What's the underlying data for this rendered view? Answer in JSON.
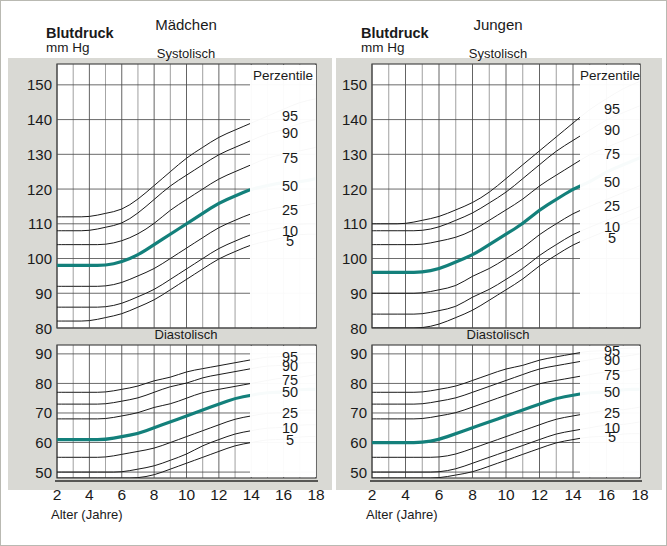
{
  "figure": {
    "background": "#ffffff",
    "plot_background": "#ffffff",
    "border_color": "#c9c9c2",
    "grid_color": "#4a4a4a",
    "curve_color": "#1a1a1a",
    "median_color": "#13807b",
    "text_color": "#1a1a1a",
    "axis_label_x": "Alter (Jahre)"
  },
  "panels": [
    {
      "id": "maedchen",
      "group_title": "Mädchen",
      "axis_title_line1": "Blutdruck",
      "axis_title_line2": "mm Hg",
      "legend_title": "Perzentile",
      "charts": [
        {
          "id": "maedchen-systolisch",
          "subtitle": "Systolisch",
          "yticks": [
            150,
            140,
            130,
            120,
            110,
            100,
            90,
            80
          ],
          "ylim": [
            80,
            156
          ],
          "percentile_labels": [
            "95",
            "90",
            "75",
            "50",
            "25",
            "10",
            "5"
          ]
        },
        {
          "id": "maedchen-diastolisch",
          "subtitle": "Diastolisch",
          "yticks": [
            90,
            80,
            70,
            60,
            50
          ],
          "ylim": [
            48,
            93
          ],
          "percentile_labels": [
            "95",
            "90",
            "75",
            "50",
            "25",
            "10",
            "5"
          ]
        }
      ]
    },
    {
      "id": "jungen",
      "group_title": "Jungen",
      "axis_title_line1": "Blutdruck",
      "axis_title_line2": "mm Hg",
      "legend_title": "Perzentile",
      "charts": [
        {
          "id": "jungen-systolisch",
          "subtitle": "Systolisch",
          "yticks": [
            150,
            140,
            130,
            120,
            110,
            100,
            90,
            80
          ],
          "ylim": [
            80,
            156
          ],
          "percentile_labels": [
            "95",
            "90",
            "75",
            "50",
            "25",
            "10",
            "5"
          ]
        },
        {
          "id": "jungen-diastolisch",
          "subtitle": "Diastolisch",
          "yticks": [
            90,
            80,
            70,
            60,
            50
          ],
          "ylim": [
            48,
            93
          ],
          "percentile_labels": [
            "95",
            "90",
            "75",
            "50",
            "25",
            "10",
            "5"
          ]
        }
      ]
    }
  ],
  "chart_data": {
    "type": "line",
    "xlabel": "Alter (Jahre)",
    "ylabel": "Blutdruck mm Hg",
    "xlim": [
      2,
      18
    ],
    "xticks": [
      2,
      4,
      6,
      8,
      10,
      12,
      14,
      16,
      18
    ],
    "x_minor_step": 1,
    "grid": true,
    "legend_position": "right-inside",
    "legend_title": "Perzentile",
    "x": [
      2,
      3,
      4,
      5,
      6,
      7,
      8,
      9,
      10,
      11,
      12,
      13,
      14,
      15,
      16,
      17,
      18
    ],
    "charts": [
      {
        "id": "maedchen-systolisch",
        "group": "Mädchen",
        "measure": "Systolisch",
        "ylim": [
          80,
          156
        ],
        "yticks": [
          150,
          140,
          130,
          120,
          110,
          100,
          90,
          80
        ],
        "series": [
          {
            "name": "95",
            "values": [
              112,
              112,
              112,
              113,
              114,
              117,
              121,
              125,
              129,
              132,
              135,
              137,
              139,
              141,
              143,
              145,
              146
            ]
          },
          {
            "name": "90",
            "values": [
              108,
              108,
              108,
              109,
              110,
              113,
              117,
              121,
              124,
              127,
              130,
              132,
              134,
              136,
              137,
              139,
              140
            ]
          },
          {
            "name": "75",
            "values": [
              104,
              104,
              104,
              104,
              105,
              107,
              110,
              114,
              117,
              120,
              123,
              125,
              127,
              129,
              130,
              131,
              132
            ]
          },
          {
            "name": "50",
            "values": [
              98,
              98,
              98,
              98,
              99,
              101,
              104,
              107,
              110,
              113,
              116,
              118,
              120,
              121,
              122,
              122,
              123
            ]
          },
          {
            "name": "25",
            "values": [
              92,
              92,
              92,
              92,
              93,
              95,
              97,
              100,
              103,
              106,
              109,
              111,
              113,
              114,
              115,
              115,
              116
            ]
          },
          {
            "name": "10",
            "values": [
              86,
              86,
              86,
              86,
              87,
              89,
              91,
              94,
              97,
              100,
              103,
              105,
              107,
              108,
              109,
              110,
              110
            ]
          },
          {
            "name": "5",
            "values": [
              82,
              82,
              82,
              83,
              84,
              86,
              88,
              91,
              94,
              97,
              100,
              102,
              104,
              105,
              106,
              107,
              107
            ]
          }
        ]
      },
      {
        "id": "maedchen-diastolisch",
        "group": "Mädchen",
        "measure": "Diastolisch",
        "ylim": [
          48,
          93
        ],
        "yticks": [
          90,
          80,
          70,
          60,
          50
        ],
        "series": [
          {
            "name": "95",
            "values": [
              77,
              77,
              77,
              77,
              78,
              79,
              81,
              82,
              84,
              85,
              86,
              87,
              88,
              89,
              89,
              90,
              90
            ]
          },
          {
            "name": "90",
            "values": [
              73,
              73,
              73,
              73,
              74,
              75,
              77,
              79,
              80,
              82,
              83,
              84,
              85,
              86,
              86,
              87,
              87
            ]
          },
          {
            "name": "75",
            "values": [
              68,
              68,
              68,
              68,
              69,
              70,
              72,
              73,
              75,
              77,
              78,
              79,
              80,
              81,
              82,
              82,
              83
            ]
          },
          {
            "name": "50",
            "values": [
              61,
              61,
              61,
              61,
              62,
              63,
              65,
              67,
              69,
              71,
              73,
              75,
              76,
              77,
              77,
              78,
              78
            ]
          },
          {
            "name": "25",
            "values": [
              55,
              55,
              55,
              55,
              56,
              57,
              58,
              60,
              62,
              64,
              66,
              68,
              69,
              70,
              70,
              71,
              71
            ]
          },
          {
            "name": "10",
            "values": [
              50,
              50,
              50,
              50,
              50,
              51,
              52,
              54,
              56,
              59,
              61,
              63,
              64,
              65,
              65,
              66,
              66
            ]
          },
          {
            "name": "5",
            "values": [
              48,
              48,
              48,
              48,
              48,
              48,
              49,
              51,
              53,
              55,
              57,
              59,
              60,
              61,
              61,
              62,
              62
            ]
          }
        ]
      },
      {
        "id": "jungen-systolisch",
        "group": "Jungen",
        "measure": "Systolisch",
        "ylim": [
          80,
          156
        ],
        "yticks": [
          150,
          140,
          130,
          120,
          110,
          100,
          90,
          80
        ],
        "series": [
          {
            "name": "95",
            "values": [
              110,
              110,
              110,
              111,
              112,
              114,
              116,
              119,
              123,
              127,
              131,
              135,
              139,
              143,
              146,
              149,
              151
            ]
          },
          {
            "name": "90",
            "values": [
              108,
              108,
              108,
              108,
              109,
              111,
              113,
              116,
              119,
              123,
              127,
              131,
              134,
              137,
              140,
              142,
              144
            ]
          },
          {
            "name": "75",
            "values": [
              104,
              104,
              104,
              104,
              105,
              106,
              108,
              111,
              114,
              117,
              121,
              124,
              127,
              130,
              132,
              134,
              136
            ]
          },
          {
            "name": "50",
            "values": [
              96,
              96,
              96,
              96,
              97,
              99,
              101,
              104,
              107,
              110,
              114,
              117,
              120,
              122,
              125,
              127,
              129
            ]
          },
          {
            "name": "25",
            "values": [
              90,
              90,
              90,
              90,
              91,
              92,
              95,
              97,
              100,
              103,
              107,
              110,
              113,
              115,
              117,
              119,
              121
            ]
          },
          {
            "name": "10",
            "values": [
              84,
              84,
              84,
              84,
              85,
              86,
              89,
              91,
              94,
              97,
              101,
              104,
              107,
              109,
              111,
              113,
              115
            ]
          },
          {
            "name": "5",
            "values": [
              80,
              80,
              80,
              80,
              81,
              83,
              85,
              88,
              91,
              94,
              98,
              101,
              104,
              106,
              108,
              110,
              112
            ]
          }
        ]
      },
      {
        "id": "jungen-diastolisch",
        "group": "Jungen",
        "measure": "Diastolisch",
        "ylim": [
          48,
          93
        ],
        "yticks": [
          90,
          80,
          70,
          60,
          50
        ],
        "series": [
          {
            "name": "95",
            "values": [
              77,
              77,
              77,
              77,
              78,
              79,
              81,
              83,
              85,
              86,
              88,
              89,
              90,
              91,
              91,
              92,
              92
            ]
          },
          {
            "name": "90",
            "values": [
              73,
              73,
              73,
              73,
              74,
              75,
              77,
              79,
              81,
              83,
              85,
              86,
              87,
              88,
              89,
              89,
              90
            ]
          },
          {
            "name": "75",
            "values": [
              68,
              68,
              68,
              68,
              69,
              70,
              72,
              74,
              76,
              78,
              80,
              81,
              82,
              83,
              84,
              84,
              85
            ]
          },
          {
            "name": "50",
            "values": [
              60,
              60,
              60,
              60,
              61,
              63,
              65,
              67,
              69,
              71,
              73,
              75,
              76,
              77,
              77,
              78,
              78
            ]
          },
          {
            "name": "25",
            "values": [
              55,
              55,
              55,
              55,
              55,
              56,
              58,
              60,
              62,
              64,
              66,
              68,
              69,
              70,
              71,
              71,
              72
            ]
          },
          {
            "name": "10",
            "values": [
              50,
              50,
              50,
              50,
              50,
              51,
              53,
              55,
              57,
              59,
              61,
              63,
              64,
              65,
              66,
              66,
              67
            ]
          },
          {
            "name": "5",
            "values": [
              48,
              48,
              48,
              48,
              48,
              49,
              50,
              52,
              54,
              56,
              58,
              60,
              61,
              62,
              62,
              63,
              63
            ]
          }
        ]
      }
    ]
  }
}
